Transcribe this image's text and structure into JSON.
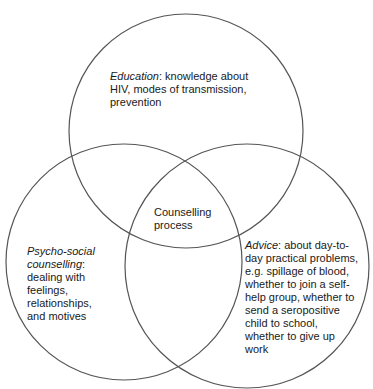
{
  "diagram": {
    "type": "venn",
    "stroke_color": "#555555",
    "circles": [
      {
        "id": "education",
        "cx": 186,
        "cy": 131,
        "r": 117
      },
      {
        "id": "psycho-social",
        "cx": 124,
        "cy": 262,
        "r": 118
      },
      {
        "id": "advice",
        "cx": 247,
        "cy": 266,
        "r": 122
      }
    ],
    "education": {
      "title": "Education",
      "text": ": knowledge about\nHIV, modes of transmission,\nprevention"
    },
    "psycho_social": {
      "title": "Psycho-social\ncounselling",
      "text": ":\ndealing with\nfeelings,\nrelationships,\nand motives"
    },
    "advice": {
      "title": "Advice",
      "text": ": about day-to-\nday practical problems,\ne.g. spillage of blood,\nwhether to join a self-\nhelp group, whether to\nsend a seropositive\nchild to school,\nwhether to give up\nwork"
    },
    "center": {
      "text": "Counselling\nprocess"
    }
  }
}
